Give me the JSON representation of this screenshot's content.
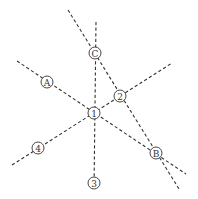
{
  "diagram": {
    "type": "axis-grid-layout",
    "background": "#ffffff",
    "line_color": "#333333",
    "lines": [
      {
        "id": "vertical-axis",
        "x1": 96,
        "y1": 22,
        "x2": 94,
        "y2": 190,
        "passes_through": [
          "C",
          "1",
          "3"
        ]
      },
      {
        "id": "diagonal-C-2-B",
        "x1": 68,
        "y1": 10,
        "x2": 179,
        "y2": 189,
        "passes_through": [
          "C",
          "2",
          "B"
        ]
      },
      {
        "id": "diagonal-A-1-B",
        "x1": 17,
        "y1": 61,
        "x2": 186,
        "y2": 174,
        "passes_through": [
          "A",
          "1",
          "B"
        ]
      },
      {
        "id": "diagonal-4-1-2",
        "x1": 12,
        "y1": 165,
        "x2": 172,
        "y2": 63,
        "passes_through": [
          "4",
          "1",
          "2"
        ]
      }
    ],
    "nodes": [
      {
        "id": "C",
        "label": "C",
        "cx": 95,
        "cy": 53,
        "r": 6
      },
      {
        "id": "A",
        "label": "A",
        "cx": 47,
        "cy": 82,
        "r": 6
      },
      {
        "id": "2",
        "label": "2",
        "cx": 120,
        "cy": 96,
        "r": 6
      },
      {
        "id": "1",
        "label": "1",
        "cx": 94,
        "cy": 113,
        "r": 6
      },
      {
        "id": "4",
        "label": "4",
        "cx": 38,
        "cy": 148,
        "r": 6
      },
      {
        "id": "B",
        "label": "B",
        "cx": 156,
        "cy": 153,
        "r": 6
      },
      {
        "id": "3",
        "label": "3",
        "cx": 94,
        "cy": 183,
        "r": 6
      }
    ]
  }
}
